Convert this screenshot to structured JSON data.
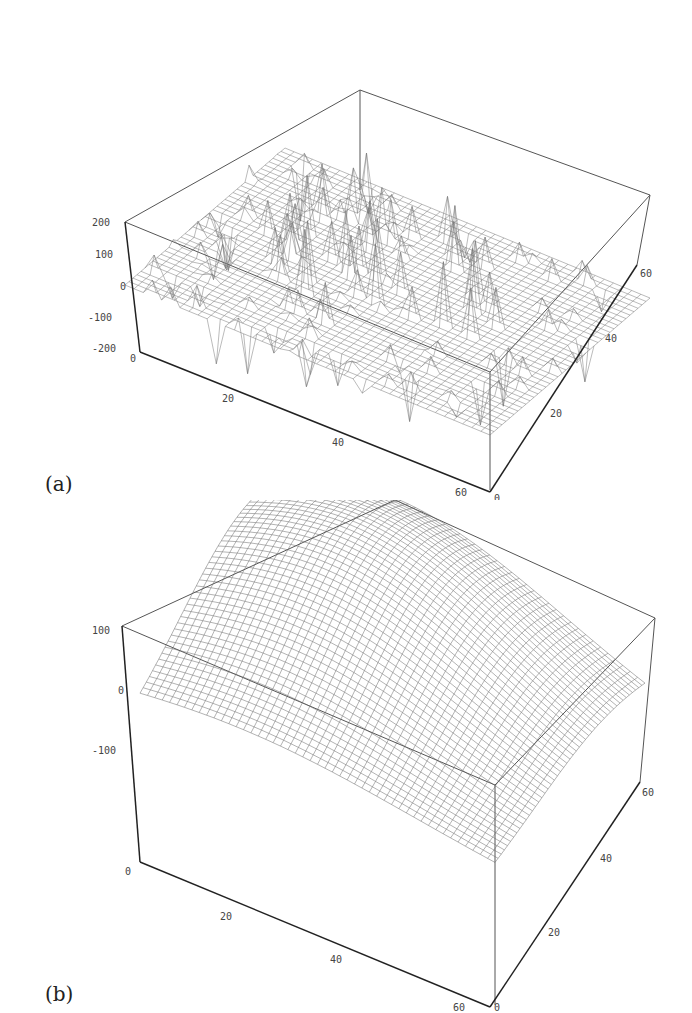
{
  "panels": [
    {
      "label": "(a)",
      "description": "3D mesh surface with sharp spikes, mostly flat plane around 0",
      "z_ticks": [
        "200",
        "100",
        "0",
        "-100",
        "-200"
      ],
      "x_ticks": [
        "0",
        "20",
        "40",
        "60"
      ],
      "y_ticks": [
        "0",
        "20",
        "40",
        "60"
      ]
    },
    {
      "label": "(b)",
      "description": "3D smooth dome-shaped mesh surface",
      "z_ticks": [
        "100",
        "0",
        "-100"
      ],
      "x_ticks": [
        "0",
        "20",
        "40",
        "60"
      ],
      "y_ticks": [
        "0",
        "20",
        "40",
        "60"
      ]
    }
  ],
  "chart_data": [
    {
      "type": "surface",
      "title": "(a)",
      "xlabel": "",
      "ylabel": "",
      "zlabel": "",
      "x_range": [
        0,
        64
      ],
      "y_range": [
        0,
        64
      ],
      "z_range": [
        -200,
        200
      ],
      "x_ticks": [
        0,
        20,
        40,
        60
      ],
      "y_ticks": [
        0,
        20,
        40,
        60
      ],
      "z_ticks": [
        -200,
        -100,
        0,
        100,
        200
      ],
      "grid_size": [
        64,
        64
      ],
      "notes": "Noisy surface: flat plane at z≈0 with many sharp positive spikes (up to ~200) concentrated in a central circular region and negative spikes (down to ~-200) near the x=60 edge"
    },
    {
      "type": "surface",
      "title": "(b)",
      "xlabel": "",
      "ylabel": "",
      "zlabel": "",
      "x_range": [
        0,
        64
      ],
      "y_range": [
        0,
        64
      ],
      "z_range": [
        -100,
        100
      ],
      "x_ticks": [
        0,
        20,
        40,
        60
      ],
      "y_ticks": [
        0,
        20,
        40,
        60
      ],
      "z_ticks": [
        -100,
        0,
        100
      ],
      "grid_size": [
        64,
        64
      ],
      "notes": "Smooth dome-shaped surface peaking near the center-back (~150) and falling to ~-60 at the corners"
    }
  ]
}
